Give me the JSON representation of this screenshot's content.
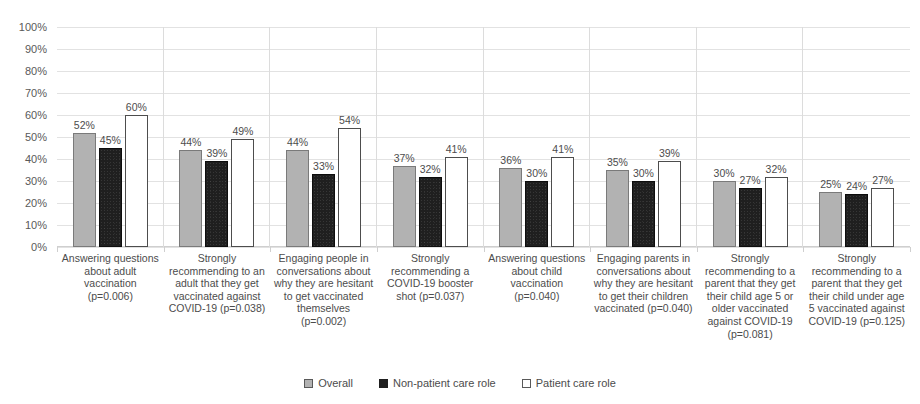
{
  "chart_data": {
    "type": "bar",
    "title": "",
    "xlabel": "",
    "ylabel": "",
    "ylim": [
      0,
      100
    ],
    "yticks": [
      "0%",
      "10%",
      "20%",
      "30%",
      "40%",
      "50%",
      "60%",
      "70%",
      "80%",
      "90%",
      "100%"
    ],
    "ytick_values": [
      0,
      10,
      20,
      30,
      40,
      50,
      60,
      70,
      80,
      90,
      100
    ],
    "grid": true,
    "legend_position": "bottom",
    "value_suffix": "%",
    "categories": [
      "Answering questions about adult vaccination (p=0.006)",
      "Strongly recommending to an adult that they get vaccinated against COVID-19 (p=0.038)",
      "Engaging people in conversations about why they are hesitant to get vaccinated themselves (p=0.002)",
      "Strongly recommending a COVID-19 booster shot (p=0.037)",
      "Answering questions about child vaccination (p=0.040)",
      "Engaging parents in conversations about why they are hesitant to get their children vaccinated (p=0.040)",
      "Strongly recommending to a parent that they get their child age 5 or older vaccinated against COVID-19 (p=0.081)",
      "Strongly recommending to a parent that they get their child under age 5 vaccinated against COVID-19 (p=0.125)"
    ],
    "series": [
      {
        "name": "Overall",
        "color": "#b2b2b2",
        "values": [
          52,
          44,
          44,
          37,
          36,
          35,
          30,
          25
        ],
        "labels": [
          "52%",
          "44%",
          "44%",
          "37%",
          "36%",
          "35%",
          "30%",
          "25%"
        ]
      },
      {
        "name": "Non-patient care role",
        "color": "#1f1f1f",
        "values": [
          45,
          39,
          33,
          32,
          30,
          30,
          27,
          24
        ],
        "labels": [
          "45%",
          "39%",
          "33%",
          "32%",
          "30%",
          "30%",
          "27%",
          "24%"
        ]
      },
      {
        "name": "Patient care role",
        "color": "#ffffff",
        "values": [
          60,
          49,
          54,
          41,
          41,
          39,
          32,
          27
        ],
        "labels": [
          "60%",
          "49%",
          "54%",
          "41%",
          "41%",
          "39%",
          "32%",
          "27%"
        ]
      }
    ]
  },
  "legend": {
    "items": [
      {
        "label": "Overall",
        "swatch": "overall-swatch-icon"
      },
      {
        "label": "Non-patient care role",
        "swatch": "nonpatient-swatch-icon"
      },
      {
        "label": "Patient care role",
        "swatch": "patient-swatch-icon"
      }
    ]
  }
}
